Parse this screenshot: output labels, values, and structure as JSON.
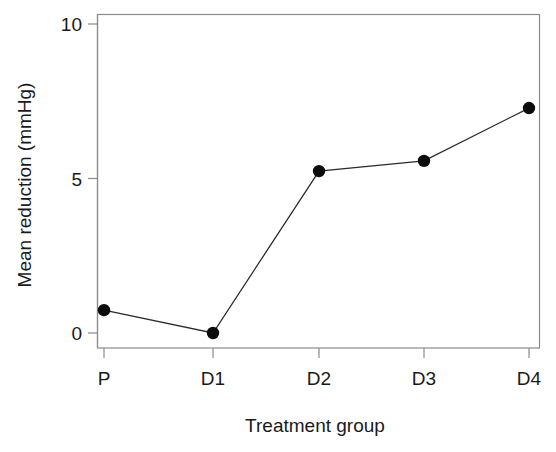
{
  "chart_data": {
    "type": "line",
    "title": "",
    "subtitle": "",
    "xlabel": "Treatment group",
    "ylabel": "Mean reduction (mmHg)",
    "categories": [
      "P",
      "D1",
      "D2",
      "D3",
      "D4"
    ],
    "values": [
      0.74,
      0.0,
      5.24,
      5.57,
      7.28
    ],
    "series": [
      {
        "name": "Mean reduction",
        "values": [
          0.74,
          0.0,
          5.24,
          5.57,
          7.28
        ]
      }
    ],
    "ylim": [
      -0.5,
      10.6
    ],
    "xlim": [
      0,
      6
    ],
    "yticks": [
      0,
      5,
      10
    ],
    "ytick_labels": [
      "0",
      "5",
      "10"
    ],
    "xtick_labels": [
      "P",
      "D1",
      "D2",
      "D3",
      "D4"
    ],
    "grid": false,
    "legend": false,
    "legend_position": "none",
    "marker": "filled-circle",
    "marker_color": "#0d0d0d",
    "line_color": "#2b2b2b",
    "frame_color": "#8a8a8a",
    "background_color": "#ffffff"
  },
  "axes": {
    "y_title": "Mean reduction (mmHg)",
    "x_title": "Treatment group",
    "y_ticks": [
      {
        "label": "10",
        "value": 10
      },
      {
        "label": "5",
        "value": 5
      },
      {
        "label": "0",
        "value": 0
      }
    ],
    "x_ticks": [
      {
        "label": "P",
        "value": 1
      },
      {
        "label": "D1",
        "value": 2
      },
      {
        "label": "D2",
        "value": 3
      },
      {
        "label": "D3",
        "value": 4
      },
      {
        "label": "D4",
        "value": 5
      }
    ]
  }
}
